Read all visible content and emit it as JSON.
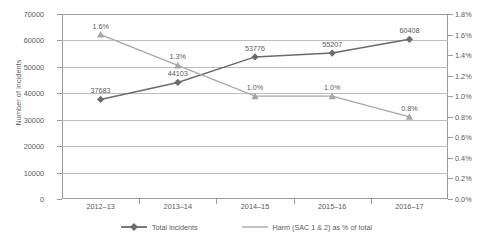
{
  "chart_data": {
    "type": "line",
    "title": "",
    "xlabel": "",
    "ylabel": "Number of incidents",
    "y2label": "",
    "categories": [
      "2012–13",
      "2013–14",
      "2014–15",
      "2015–16",
      "2016–17"
    ],
    "ylim": [
      0,
      70000
    ],
    "y2lim": [
      0,
      1.8
    ],
    "yticks": [
      "0",
      "10000",
      "20000",
      "30000",
      "40000",
      "50000",
      "60000",
      "70000"
    ],
    "ytick_values": [
      0,
      10000,
      20000,
      30000,
      40000,
      50000,
      60000,
      70000
    ],
    "y2ticks": [
      "0.0%",
      "0.2%",
      "0.4%",
      "0.6%",
      "0.8%",
      "1.0%",
      "1.2%",
      "1.4%",
      "1.6%",
      "1.8%"
    ],
    "y2tick_values": [
      0,
      0.2,
      0.4,
      0.6,
      0.8,
      1.0,
      1.2,
      1.4,
      1.6,
      1.8
    ],
    "grid": true,
    "legend_position": "bottom",
    "series": [
      {
        "name": "Total incidents",
        "axis": "left",
        "color": "#6b6b6b",
        "marker": "diamond",
        "values": [
          37683,
          44103,
          53776,
          55207,
          60408
        ],
        "labels": [
          "37683",
          "44103",
          "53776",
          "55207",
          "60408"
        ]
      },
      {
        "name": "Harm (SAC 1 & 2) as % of total",
        "axis": "right",
        "color": "#a6a6a6",
        "marker": "triangle",
        "values": [
          1.6,
          1.3,
          1.0,
          1.0,
          0.8
        ],
        "labels": [
          "1.6%",
          "1.3%",
          "1.0%",
          "1.0%",
          "0.8%"
        ]
      }
    ]
  }
}
